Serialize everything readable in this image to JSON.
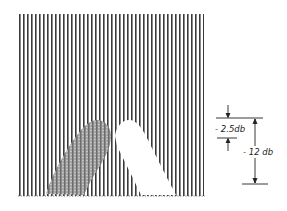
{
  "figure": {
    "grating": {
      "x_start": 19,
      "x_end": 204,
      "y_top": 14,
      "y_bottom": 196,
      "spacing": 4,
      "line_color": "#3a3a3a"
    },
    "regions": {
      "shaded": {
        "name": "shaded-region",
        "color": "#9a9a9a"
      },
      "white": {
        "name": "white-region",
        "color": "#ffffff"
      }
    },
    "annotations": {
      "small_dimension_label": "- 2.5db",
      "large_dimension_label": "- 12 db"
    }
  }
}
